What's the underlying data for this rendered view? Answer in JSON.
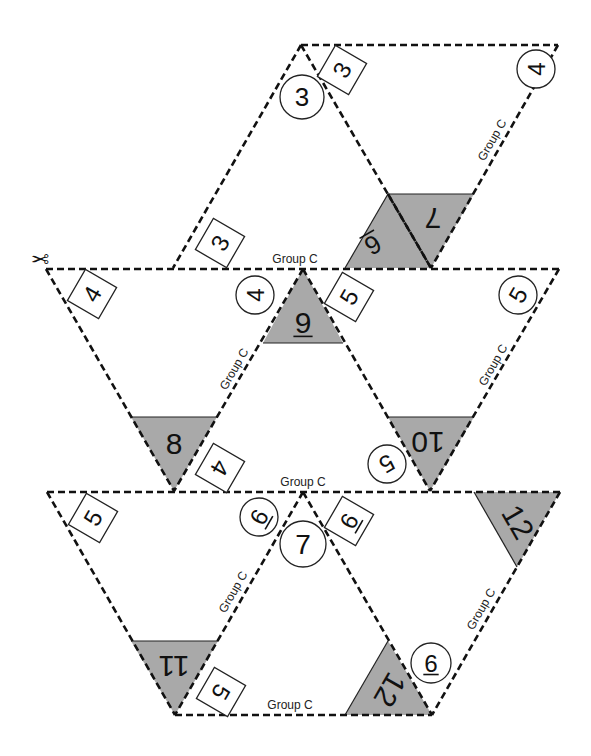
{
  "scissor_icon": "✂",
  "colors": {
    "shade": "#a9a9a9",
    "line": "#111111",
    "background": "#ffffff"
  },
  "cut_lines": [
    {
      "id": "top-rhombus-top",
      "x1": 301,
      "y1": 45,
      "x2": 558,
      "y2": 45
    },
    {
      "id": "top-rhombus-left",
      "x1": 301,
      "y1": 45,
      "x2": 173,
      "y2": 268
    },
    {
      "id": "top-rhombus-diag",
      "x1": 301,
      "y1": 45,
      "x2": 431,
      "y2": 268
    },
    {
      "id": "top-rhombus-right",
      "x1": 558,
      "y1": 45,
      "x2": 431,
      "y2": 268
    },
    {
      "id": "top-gray-divider",
      "x1": 388,
      "y1": 194,
      "x2": 431,
      "y2": 268
    },
    {
      "id": "row2-top",
      "x1": 46,
      "y1": 269,
      "x2": 559,
      "y2": 269
    },
    {
      "id": "row2-left-outer",
      "x1": 46,
      "y1": 269,
      "x2": 174,
      "y2": 491
    },
    {
      "id": "row2-left-inner",
      "x1": 303,
      "y1": 269,
      "x2": 174,
      "y2": 491
    },
    {
      "id": "row2-right-inner",
      "x1": 303,
      "y1": 269,
      "x2": 430,
      "y2": 491
    },
    {
      "id": "row2-right-outer",
      "x1": 559,
      "y1": 269,
      "x2": 430,
      "y2": 491
    },
    {
      "id": "row3-top",
      "x1": 47,
      "y1": 492,
      "x2": 560,
      "y2": 492
    },
    {
      "id": "row3-left-outer",
      "x1": 47,
      "y1": 492,
      "x2": 175,
      "y2": 715
    },
    {
      "id": "row3-left-inner",
      "x1": 303,
      "y1": 492,
      "x2": 175,
      "y2": 715
    },
    {
      "id": "row3-right-inner",
      "x1": 303,
      "y1": 492,
      "x2": 432,
      "y2": 715
    },
    {
      "id": "row3-right-outer",
      "x1": 560,
      "y1": 492,
      "x2": 432,
      "y2": 715
    },
    {
      "id": "bottom-line",
      "x1": 175,
      "y1": 715,
      "x2": 432,
      "y2": 715
    }
  ],
  "gray_regions": [
    {
      "id": "top-parallelogram",
      "points": "388,194 474,194 431,268 345,268"
    },
    {
      "id": "row2-nine",
      "points": "303,269 343,343 263,343"
    },
    {
      "id": "row2-eight",
      "points": "131,417 217,417 174,491"
    },
    {
      "id": "row2-ten",
      "points": "388,417 474,417 430,491"
    },
    {
      "id": "row3-twelve-top",
      "points": "474,492 560,492 517,567"
    },
    {
      "id": "row3-eleven",
      "points": "131,641 218,641 175,715"
    },
    {
      "id": "row3-twelve-bottom",
      "points": "388,641 345,715 432,715"
    }
  ],
  "solid_edges": [
    {
      "x1": 388,
      "y1": 194,
      "x2": 474,
      "y2": 194
    },
    {
      "x1": 388,
      "y1": 194,
      "x2": 345,
      "y2": 268
    },
    {
      "x1": 263,
      "y1": 343,
      "x2": 343,
      "y2": 343
    },
    {
      "x1": 131,
      "y1": 417,
      "x2": 217,
      "y2": 417
    },
    {
      "x1": 388,
      "y1": 417,
      "x2": 474,
      "y2": 417
    },
    {
      "x1": 474,
      "y1": 492,
      "x2": 517,
      "y2": 567
    },
    {
      "x1": 131,
      "y1": 641,
      "x2": 218,
      "y2": 641
    },
    {
      "x1": 388,
      "y1": 641,
      "x2": 345,
      "y2": 715
    }
  ],
  "circles": [
    {
      "id": "c-3",
      "x": 302,
      "y": 97,
      "r": 22,
      "text": "3",
      "rot": 0,
      "size": 26
    },
    {
      "id": "c-4-top",
      "x": 536,
      "y": 69,
      "r": 19,
      "text": "4",
      "rot": -90,
      "size": 24
    },
    {
      "id": "c-4-row2",
      "x": 255,
      "y": 295,
      "r": 19,
      "text": "4",
      "rot": -90,
      "size": 24
    },
    {
      "id": "c-5-row2-right",
      "x": 518,
      "y": 295,
      "r": 19,
      "text": "5",
      "rot": -60,
      "size": 24
    },
    {
      "id": "c-5-row2-bottom",
      "x": 387,
      "y": 464,
      "r": 19,
      "text": "5",
      "rot": 150,
      "size": 24
    },
    {
      "id": "c-6-row3",
      "x": 259,
      "y": 517,
      "r": 19,
      "text": "6",
      "rot": -60,
      "size": 24,
      "mark": "left"
    },
    {
      "id": "c-7",
      "x": 303,
      "y": 544,
      "r": 23,
      "text": "7",
      "rot": 0,
      "size": 28
    },
    {
      "id": "c-9-row3",
      "x": 431,
      "y": 663,
      "r": 20,
      "text": "9",
      "rot": 180,
      "size": 24,
      "mark": "over"
    }
  ],
  "boxes": [
    {
      "id": "b-3-top",
      "x": 342,
      "y": 70,
      "w": 36,
      "h": 36,
      "text": "3",
      "rot": -60,
      "size": 24
    },
    {
      "id": "b-3-lower",
      "x": 220,
      "y": 243,
      "w": 36,
      "h": 36,
      "text": "3",
      "rot": -60,
      "size": 24
    },
    {
      "id": "b-4-row2-left",
      "x": 92,
      "y": 294,
      "w": 36,
      "h": 36,
      "text": "4",
      "rot": -60,
      "size": 24
    },
    {
      "id": "b-5-row2",
      "x": 349,
      "y": 297,
      "w": 36,
      "h": 36,
      "text": "5",
      "rot": -60,
      "size": 24
    },
    {
      "id": "b-4-row2-bottom",
      "x": 220,
      "y": 468,
      "w": 36,
      "h": 36,
      "text": "4",
      "rot": 120,
      "size": 24
    },
    {
      "id": "b-5-row3-left",
      "x": 93,
      "y": 518,
      "w": 36,
      "h": 36,
      "text": "5",
      "rot": -60,
      "size": 24
    },
    {
      "id": "b-6-row3",
      "x": 349,
      "y": 521,
      "w": 36,
      "h": 36,
      "text": "6",
      "rot": -60,
      "size": 24,
      "mark": "under"
    },
    {
      "id": "b-5-row3-bottom",
      "x": 221,
      "y": 692,
      "w": 36,
      "h": 36,
      "text": "5",
      "rot": 120,
      "size": 24
    }
  ],
  "gray_numbers": [
    {
      "id": "n-7",
      "x": 433,
      "y": 218,
      "text": "7",
      "rot": 180,
      "size": 30
    },
    {
      "id": "n-6",
      "x": 373,
      "y": 245,
      "text": "6",
      "rot": 150,
      "size": 26,
      "mark": "under"
    },
    {
      "id": "n-9",
      "x": 303,
      "y": 322,
      "text": "9",
      "rot": 0,
      "size": 30,
      "mark": "under"
    },
    {
      "id": "n-8",
      "x": 174,
      "y": 443,
      "text": "8",
      "rot": 0,
      "size": 30
    },
    {
      "id": "n-10",
      "x": 428,
      "y": 442,
      "text": "10",
      "rot": 180,
      "size": 30
    },
    {
      "id": "n-12-top",
      "x": 518,
      "y": 522,
      "text": "12",
      "rot": 60,
      "size": 30
    },
    {
      "id": "n-11",
      "x": 174,
      "y": 666,
      "text": "11",
      "rot": 180,
      "size": 30
    },
    {
      "id": "n-12-bottom",
      "x": 390,
      "y": 690,
      "text": "12",
      "rot": 120,
      "size": 30
    }
  ],
  "labels": [
    {
      "id": "lbl-top-right",
      "x": 492,
      "y": 140,
      "text": "Group C",
      "rot": -60
    },
    {
      "id": "lbl-row1-bottom",
      "x": 295,
      "y": 259,
      "text": "Group C",
      "rot": 0
    },
    {
      "id": "lbl-row2-left",
      "x": 234,
      "y": 369,
      "text": "Group C",
      "rot": -60
    },
    {
      "id": "lbl-row2-right",
      "x": 493,
      "y": 365,
      "text": "Group C",
      "rot": -60
    },
    {
      "id": "lbl-row2-bottom",
      "x": 303,
      "y": 482,
      "text": "Group C",
      "rot": 0
    },
    {
      "id": "lbl-row3-left",
      "x": 233,
      "y": 592,
      "text": "Group C",
      "rot": -60
    },
    {
      "id": "lbl-row3-right",
      "x": 481,
      "y": 609,
      "text": "Group C",
      "rot": -60
    },
    {
      "id": "lbl-bottom",
      "x": 290,
      "y": 705,
      "text": "Group C",
      "rot": 0
    }
  ],
  "scissor": {
    "x": 40,
    "y": 258,
    "rot": 180
  }
}
